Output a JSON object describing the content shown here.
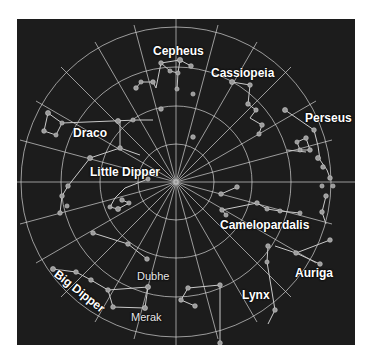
{
  "chart": {
    "type": "polar-star-chart",
    "background_color": "#1c1c1c",
    "grid_color": "#d8d8d8",
    "star_color": "#9a9a9a",
    "rings": 4,
    "spokes": 24
  },
  "constellations": [
    {
      "name": "Cepheus"
    },
    {
      "name": "Cassiopeia"
    },
    {
      "name": "Perseus"
    },
    {
      "name": "Draco"
    },
    {
      "name": "Little Dipper"
    },
    {
      "name": "Camelopardalis"
    },
    {
      "name": "Auriga"
    },
    {
      "name": "Lynx"
    },
    {
      "name": "Big Dipper"
    }
  ],
  "stars": [
    {
      "name": "Dubhe"
    },
    {
      "name": "Merak"
    }
  ]
}
